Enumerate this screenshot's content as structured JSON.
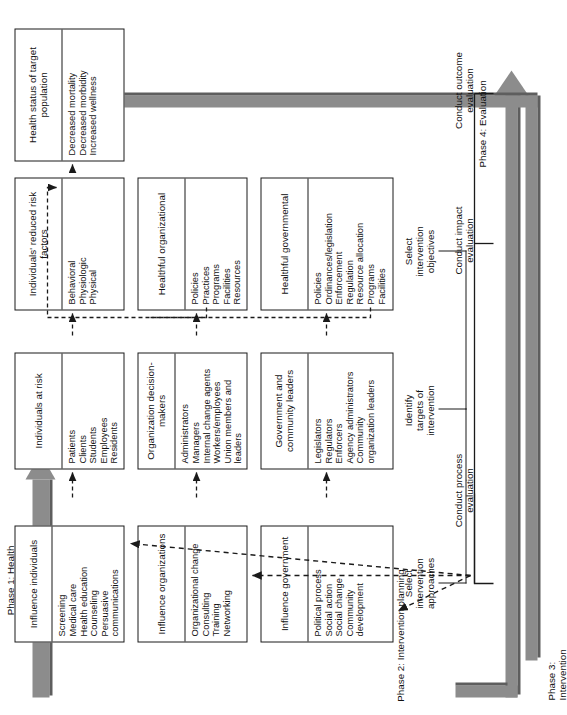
{
  "diagram": {
    "phases": {
      "phase1": "Phase 1: Health\ngoals selection",
      "phase2": "Phase 2: Intervention planning",
      "phase3": "Phase 3:\nIntervention",
      "phase4": "Phase 4: Evaluation"
    },
    "column_labels": {
      "select_approaches": "Select\nintervention\napproaches",
      "identify_targets": "Identify\ntargets of\nintervention",
      "select_objectives": "Select\nintervention\nobjectives"
    },
    "evaluation_labels": {
      "process": "Conduct process\nevaluation",
      "impact": "Conduct impact\nevaluation",
      "outcome": "Conduct outcome\nevaluation"
    },
    "rows": [
      {
        "name": "government",
        "approach": {
          "header": "Influence\ngovernment",
          "items": [
            "Political process",
            "Social action",
            "Social change",
            "Community",
            "  development"
          ]
        },
        "target": {
          "header": "Government and\ncommunity leaders",
          "items": [
            "Legislators",
            "Regulators",
            "Enforcers",
            "Agency administrators",
            "Community",
            "  organization leaders"
          ]
        },
        "objective": {
          "header": "Healthful\ngovernmental",
          "items": [
            "Policies",
            "Ordinances/legislation",
            "Enforcement",
            "Regulation",
            "Resource allocation",
            "Programs",
            "Facilities"
          ]
        }
      },
      {
        "name": "organizations",
        "approach": {
          "header": "Influence\norganizations",
          "items": [
            "Organizational change",
            "Consulting",
            "Training",
            "Networking"
          ]
        },
        "target": {
          "header": "Organization\ndecision-makers",
          "items": [
            "Administrators",
            "Managers",
            "Internal change agents",
            "Workers/employees",
            "Union members and",
            "  leaders"
          ]
        },
        "objective": {
          "header": "Healthful\norganizational",
          "items": [
            "Policies",
            "Practices",
            "Programs",
            "Facilities",
            "Resources"
          ]
        }
      },
      {
        "name": "individuals",
        "approach": {
          "header": "Influence\nindividuals",
          "items": [
            "Screening",
            "Medical care",
            "Health education",
            "Counseling",
            "Persuasive",
            "  communications"
          ]
        },
        "target": {
          "header": "Individuals at risk",
          "items": [
            "Patients",
            "Clients",
            "Students",
            "Employees",
            "Residents"
          ]
        },
        "objective": {
          "header": "Individuals' reduced\nrisk factors",
          "items": [
            "Behavioral",
            "Physiologic",
            "Physical"
          ]
        }
      }
    ],
    "outcome_box": {
      "header": "Health status of\ntarget population",
      "items": [
        "Decreased mortality",
        "Decreased morbidity",
        "Increased wellness"
      ]
    },
    "colors": {
      "arrow_fill": "#8c8c8c",
      "arrow_shadow": "#5e5e5e",
      "line": "#1a1a1a",
      "background": "#ffffff"
    }
  }
}
